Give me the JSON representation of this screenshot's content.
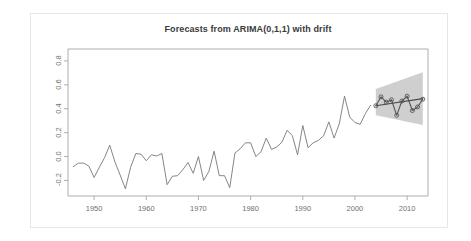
{
  "chart_data": {
    "type": "line",
    "title": "Forecasts from ARIMA(0,1,1) with drift",
    "xlabel": "",
    "ylabel": "",
    "xlim": [
      1945,
      2014
    ],
    "ylim": [
      -0.33,
      0.9
    ],
    "grid": false,
    "legend": null,
    "xticks": [
      1950,
      1960,
      1970,
      1980,
      1990,
      2000,
      2010
    ],
    "xtick_labels": [
      "1950",
      "1960",
      "1970",
      "1980",
      "1990",
      "2000",
      "2010"
    ],
    "yticks": [
      -0.2,
      0.0,
      0.2,
      0.4,
      0.6,
      0.8
    ],
    "ytick_labels": [
      "-0.2",
      "0.0",
      "0.2",
      "0.4",
      "0.6",
      "0.8"
    ],
    "series": [
      {
        "name": "historical",
        "style": "line",
        "color": "#777777",
        "x": [
          1946,
          1947,
          1948,
          1949,
          1950,
          1951,
          1952,
          1953,
          1954,
          1955,
          1956,
          1957,
          1958,
          1959,
          1960,
          1961,
          1962,
          1963,
          1964,
          1965,
          1966,
          1967,
          1968,
          1969,
          1970,
          1971,
          1972,
          1973,
          1974,
          1975,
          1976,
          1977,
          1978,
          1979,
          1980,
          1981,
          1982,
          1983,
          1984,
          1985,
          1986,
          1987,
          1988,
          1989,
          1990,
          1991,
          1992,
          1993,
          1994,
          1995,
          1996,
          1997,
          1998,
          1999,
          2000,
          2001,
          2002,
          2003
        ],
        "values": [
          -0.085,
          -0.055,
          -0.055,
          -0.08,
          -0.175,
          -0.09,
          -0.01,
          0.095,
          -0.045,
          -0.155,
          -0.27,
          -0.09,
          0.025,
          0.02,
          -0.035,
          0.015,
          0.005,
          0.025,
          -0.235,
          -0.165,
          -0.16,
          -0.11,
          -0.05,
          -0.14,
          0.0,
          -0.2,
          -0.125,
          0.045,
          -0.16,
          -0.16,
          -0.26,
          0.03,
          0.065,
          0.115,
          0.115,
          0.0,
          0.04,
          0.155,
          0.06,
          0.08,
          0.12,
          0.22,
          0.175,
          0.015,
          0.26,
          0.075,
          0.115,
          0.135,
          0.175,
          0.29,
          0.155,
          0.275,
          0.505,
          0.33,
          0.285,
          0.27,
          0.36,
          0.43
        ]
      },
      {
        "name": "forecast",
        "style": "line-with-open-circle-markers",
        "color": "#555555",
        "x": [
          2004,
          2005,
          2006,
          2007,
          2008,
          2009,
          2010,
          2011,
          2012,
          2013
        ],
        "values": [
          0.425,
          0.5,
          0.455,
          0.475,
          0.345,
          0.465,
          0.505,
          0.385,
          0.415,
          0.48
        ]
      },
      {
        "name": "drift-trend",
        "style": "line",
        "color": "#4a4a4a",
        "x": [
          2004,
          2013
        ],
        "values": [
          0.425,
          0.485
        ]
      }
    ],
    "prediction_interval": {
      "name": "forecast-interval-band",
      "fill": "#bfbfbf",
      "x": [
        2004,
        2013
      ],
      "upper": [
        0.565,
        0.705
      ],
      "lower": [
        0.345,
        0.265
      ]
    },
    "colors": {
      "axis": "#9a9a9a",
      "title": "#3a3a3a",
      "tick_label": "#707070",
      "historical_line": "#777777",
      "forecast_line": "#555555",
      "band_fill": "#bfbfbf",
      "card_border": "#e7e7e7",
      "background": "#ffffff"
    }
  }
}
